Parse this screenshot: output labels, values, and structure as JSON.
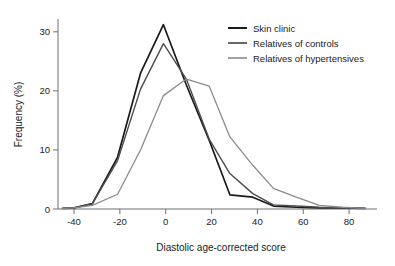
{
  "chart_data": {
    "type": "line",
    "title": "",
    "subtitle": "",
    "xlabel": "Diastolic age-corrected score",
    "ylabel": "Frequency (%)",
    "xlim": [
      -47,
      90
    ],
    "ylim": [
      0,
      32
    ],
    "xticks": [
      -40,
      -20,
      0,
      20,
      40,
      60,
      80
    ],
    "xtick_labels": [
      "-40",
      "-20",
      "0",
      "20",
      "40",
      "60",
      "80"
    ],
    "yticks": [
      0,
      10,
      20,
      30
    ],
    "ytick_labels": [
      "0",
      "10",
      "20",
      "30"
    ],
    "grid": false,
    "legend_position": "top-right",
    "series": [
      {
        "name": "Skin clinic",
        "color": "#1a1a1a",
        "linewidth": 1.7,
        "x": [
          -45,
          -40,
          -32,
          -21,
          -11,
          -1,
          9,
          19,
          28,
          38,
          47,
          57,
          67,
          77,
          87
        ],
        "values": [
          0.1,
          0.2,
          0.9,
          8.8,
          23.0,
          31.2,
          21.0,
          11.6,
          2.4,
          2.0,
          0.5,
          0.3,
          0.2,
          0.2,
          0.1
        ]
      },
      {
        "name": "Relatives of controls",
        "color": "#4d4d4d",
        "linewidth": 1.4,
        "x": [
          -45,
          -40,
          -32,
          -21,
          -11,
          -1,
          9,
          19,
          28,
          38,
          47,
          57,
          67,
          77,
          87
        ],
        "values": [
          0.1,
          0.2,
          0.9,
          8.2,
          20.3,
          28.0,
          22.0,
          11.8,
          6.0,
          2.6,
          0.7,
          0.5,
          0.3,
          0.2,
          0.1
        ]
      },
      {
        "name": "Relatives of hypertensives",
        "color": "#8c8c8c",
        "linewidth": 1.3,
        "x": [
          -45,
          -40,
          -32,
          -21,
          -11,
          -1,
          9,
          19,
          28,
          38,
          47,
          57,
          67,
          77,
          87
        ],
        "values": [
          0.1,
          0.2,
          0.6,
          2.5,
          10.0,
          19.2,
          22.0,
          20.8,
          12.2,
          7.4,
          3.5,
          2.0,
          0.6,
          0.3,
          0.1
        ]
      }
    ]
  },
  "legend": {
    "items": [
      {
        "label": "Skin clinic"
      },
      {
        "label": "Relatives of controls"
      },
      {
        "label": "Relatives of hypertensives"
      }
    ]
  },
  "axes": {
    "x_title": "Diastolic age-corrected score",
    "y_title": "Frequency (%)"
  }
}
